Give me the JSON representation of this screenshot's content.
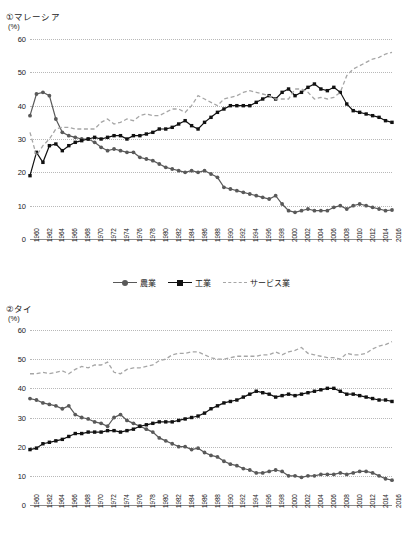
{
  "page": {
    "unit_label": "(%)"
  },
  "legend": {
    "items": [
      {
        "label": "農業",
        "key": "agriculture",
        "color": "#595959",
        "style": "solid-circle"
      },
      {
        "label": "工業",
        "key": "industry",
        "color": "#111111",
        "style": "solid-square"
      },
      {
        "label": "サービス業",
        "key": "services",
        "color": "#a6a6a6",
        "style": "dashed"
      }
    ]
  },
  "charts": [
    {
      "id": "malaysia",
      "panel_title": "①マレーシア",
      "chart_data": {
        "type": "line",
        "title": "①マレーシア",
        "xlabel": "",
        "ylabel": "(%)",
        "ylim": [
          0,
          60
        ],
        "yticks": [
          0,
          10,
          20,
          30,
          40,
          50,
          60
        ],
        "grid": true,
        "legend_position": "bottom",
        "x": [
          1960,
          1961,
          1962,
          1963,
          1964,
          1965,
          1966,
          1967,
          1968,
          1969,
          1970,
          1971,
          1972,
          1973,
          1974,
          1975,
          1976,
          1977,
          1978,
          1979,
          1980,
          1981,
          1982,
          1983,
          1984,
          1985,
          1986,
          1987,
          1988,
          1989,
          1990,
          1991,
          1992,
          1993,
          1994,
          1995,
          1996,
          1997,
          1998,
          1999,
          2000,
          2001,
          2002,
          2003,
          2004,
          2005,
          2006,
          2007,
          2008,
          2009,
          2010,
          2011,
          2012,
          2013,
          2014,
          2015,
          2016
        ],
        "tick_labels": [
          "1960",
          "1962",
          "1964",
          "1966",
          "1968",
          "1970",
          "1972",
          "1974",
          "1976",
          "1978",
          "1980",
          "1982",
          "1984",
          "1986",
          "1988",
          "1990",
          "1992",
          "1994",
          "1996",
          "1998",
          "2000",
          "2002",
          "2004",
          "2006",
          "2008",
          "2010",
          "2012",
          "2014",
          "2016"
        ],
        "series": [
          {
            "name": "農業",
            "key": "agriculture",
            "color": "#595959",
            "values": [
              37.0,
              43.5,
              44.0,
              43.0,
              36.0,
              32.0,
              31.0,
              30.5,
              30.0,
              30.0,
              29.0,
              27.5,
              26.5,
              27.0,
              26.5,
              26.0,
              26.0,
              24.5,
              24.0,
              23.5,
              22.5,
              21.5,
              21.0,
              20.5,
              20.0,
              20.5,
              20.0,
              20.5,
              19.5,
              18.5,
              15.5,
              15.0,
              14.5,
              14.0,
              13.5,
              13.0,
              12.5,
              12.0,
              13.0,
              10.5,
              8.5,
              8.0,
              8.5,
              9.0,
              8.5,
              8.5,
              8.5,
              9.5,
              10.0,
              9.0,
              10.0,
              10.5,
              10.0,
              9.5,
              9.0,
              8.5,
              8.7
            ]
          },
          {
            "name": "工業",
            "key": "industry",
            "color": "#111111",
            "values": [
              19.0,
              26.0,
              23.0,
              28.0,
              28.5,
              26.5,
              28.0,
              29.0,
              29.5,
              30.0,
              30.5,
              30.0,
              30.5,
              31.0,
              31.0,
              30.0,
              31.0,
              31.0,
              31.5,
              32.0,
              33.0,
              33.0,
              33.5,
              34.5,
              35.5,
              34.0,
              33.0,
              35.0,
              36.5,
              38.0,
              39.0,
              40.0,
              40.0,
              40.0,
              40.0,
              41.0,
              42.0,
              43.0,
              42.0,
              44.0,
              45.0,
              43.0,
              44.0,
              45.5,
              46.5,
              45.0,
              44.5,
              45.5,
              44.0,
              40.5,
              38.5,
              38.0,
              37.5,
              37.0,
              36.5,
              35.5,
              35.0
            ]
          },
          {
            "name": "サービス業",
            "key": "services",
            "color": "#a6a6a6",
            "values": [
              32.0,
              25.0,
              28.0,
              30.0,
              33.0,
              33.5,
              33.5,
              33.0,
              33.0,
              33.0,
              33.0,
              35.0,
              36.0,
              34.5,
              35.0,
              36.0,
              35.5,
              37.0,
              37.5,
              37.0,
              37.0,
              38.0,
              39.0,
              39.0,
              38.0,
              40.0,
              43.0,
              42.0,
              41.0,
              40.0,
              42.0,
              42.5,
              43.0,
              44.0,
              44.5,
              44.0,
              43.5,
              43.0,
              42.0,
              42.0,
              42.0,
              45.0,
              45.0,
              44.0,
              42.0,
              42.5,
              42.0,
              42.5,
              44.0,
              49.0,
              51.0,
              52.0,
              53.0,
              54.0,
              54.5,
              55.5,
              56.0
            ]
          }
        ]
      }
    },
    {
      "id": "thailand",
      "panel_title": "②タイ",
      "chart_data": {
        "type": "line",
        "title": "②タイ",
        "xlabel": "",
        "ylabel": "(%)",
        "ylim": [
          0,
          60
        ],
        "yticks": [
          0,
          10,
          20,
          30,
          40,
          50,
          60
        ],
        "grid": true,
        "legend_position": "bottom",
        "x": [
          1960,
          1961,
          1962,
          1963,
          1964,
          1965,
          1966,
          1967,
          1968,
          1969,
          1970,
          1971,
          1972,
          1973,
          1974,
          1975,
          1976,
          1977,
          1978,
          1979,
          1980,
          1981,
          1982,
          1983,
          1984,
          1985,
          1986,
          1987,
          1988,
          1989,
          1990,
          1991,
          1992,
          1993,
          1994,
          1995,
          1996,
          1997,
          1998,
          1999,
          2000,
          2001,
          2002,
          2003,
          2004,
          2005,
          2006,
          2007,
          2008,
          2009,
          2010,
          2011,
          2012,
          2013,
          2014,
          2015,
          2016
        ],
        "tick_labels": [
          "1960",
          "1962",
          "1964",
          "1966",
          "1968",
          "1970",
          "1972",
          "1974",
          "1976",
          "1978",
          "1980",
          "1982",
          "1984",
          "1986",
          "1988",
          "1990",
          "1992",
          "1994",
          "1996",
          "1998",
          "2000",
          "2002",
          "2004",
          "2006",
          "2008",
          "2010",
          "2012",
          "2014",
          "2016"
        ],
        "series": [
          {
            "name": "農業",
            "key": "agriculture",
            "color": "#595959",
            "values": [
              36.5,
              36.0,
              35.0,
              34.5,
              34.0,
              33.0,
              34.0,
              31.0,
              30.0,
              29.5,
              28.5,
              28.0,
              27.0,
              30.0,
              31.0,
              29.0,
              28.0,
              27.0,
              26.0,
              25.0,
              23.0,
              22.0,
              21.0,
              20.0,
              20.0,
              19.0,
              19.5,
              18.0,
              17.0,
              16.5,
              15.0,
              14.0,
              13.5,
              12.5,
              12.0,
              11.0,
              11.0,
              11.5,
              12.0,
              11.5,
              10.0,
              10.0,
              9.5,
              10.0,
              10.0,
              10.5,
              10.5,
              10.5,
              11.0,
              10.5,
              11.0,
              11.5,
              11.5,
              11.0,
              10.0,
              9.0,
              8.5
            ]
          },
          {
            "name": "工業",
            "key": "industry",
            "color": "#111111",
            "values": [
              19.0,
              19.5,
              21.0,
              21.5,
              22.0,
              22.5,
              23.5,
              24.5,
              24.5,
              25.0,
              25.0,
              25.0,
              25.5,
              25.5,
              25.0,
              25.5,
              26.0,
              27.0,
              27.5,
              28.0,
              28.5,
              28.5,
              28.5,
              29.0,
              29.5,
              30.0,
              30.5,
              31.5,
              33.0,
              34.0,
              35.0,
              35.5,
              36.0,
              37.0,
              38.0,
              39.0,
              38.5,
              38.0,
              37.0,
              37.5,
              38.0,
              37.5,
              38.0,
              38.5,
              39.0,
              39.5,
              40.0,
              40.0,
              39.0,
              38.0,
              38.0,
              37.5,
              37.0,
              36.5,
              36.0,
              36.0,
              35.5
            ]
          },
          {
            "name": "サービス業",
            "key": "services",
            "color": "#a6a6a6",
            "values": [
              45.0,
              45.0,
              45.5,
              45.0,
              45.5,
              46.0,
              45.0,
              46.5,
              47.5,
              47.0,
              48.0,
              48.0,
              49.0,
              45.5,
              45.0,
              46.5,
              47.0,
              47.0,
              47.5,
              48.0,
              49.5,
              50.0,
              51.5,
              52.0,
              52.0,
              52.5,
              52.5,
              51.5,
              50.5,
              50.0,
              50.0,
              50.5,
              51.0,
              51.0,
              51.0,
              51.0,
              51.5,
              51.5,
              52.5,
              51.5,
              52.5,
              53.0,
              54.0,
              52.0,
              51.5,
              51.0,
              50.5,
              50.5,
              50.0,
              52.0,
              51.5,
              51.5,
              52.0,
              53.5,
              54.5,
              55.0,
              56.0
            ]
          }
        ]
      }
    }
  ]
}
